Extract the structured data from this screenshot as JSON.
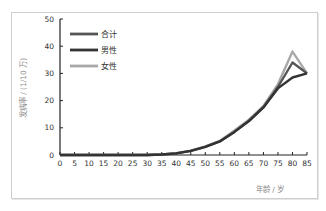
{
  "chart_data": {
    "type": "line",
    "title": "",
    "xlabel": "年龄 / 岁",
    "ylabel": "发病率 / (1/10 万)",
    "xlim": [
      0,
      85
    ],
    "ylim": [
      0,
      50
    ],
    "x_ticks": [
      "0",
      "5",
      "10",
      "15",
      "20",
      "25",
      "30",
      "35",
      "40",
      "45",
      "50",
      "55",
      "60",
      "65",
      "70",
      "75",
      "80",
      "85"
    ],
    "y_ticks": [
      "0",
      "10",
      "20",
      "30",
      "40",
      "50"
    ],
    "grid": false,
    "legend_position": "upper-left-inside",
    "x": [
      0,
      5,
      10,
      15,
      20,
      25,
      30,
      35,
      40,
      45,
      50,
      55,
      60,
      65,
      70,
      75,
      80,
      85
    ],
    "series": [
      {
        "name": "合计",
        "color": "#555555",
        "values": [
          0,
          0,
          0,
          0,
          0,
          0,
          0,
          0.2,
          0.6,
          1.5,
          3,
          5,
          8.5,
          12.5,
          17.5,
          25,
          34,
          30
        ]
      },
      {
        "name": "男性",
        "color": "#333333",
        "values": [
          0,
          0,
          0,
          0,
          0,
          0,
          0,
          0.2,
          0.6,
          1.5,
          3,
          5,
          8.5,
          12.5,
          17.5,
          24.5,
          28.5,
          30
        ]
      },
      {
        "name": "女性",
        "color": "#a8a8a8",
        "values": [
          0,
          0,
          0,
          0,
          0,
          0,
          0,
          0.2,
          0.7,
          1.6,
          3.2,
          5.2,
          9,
          13,
          18,
          26,
          38,
          30
        ]
      }
    ]
  }
}
